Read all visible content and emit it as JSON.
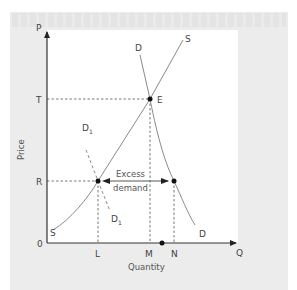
{
  "diagram": {
    "type": "supply-demand",
    "axes": {
      "y_symbol": "P",
      "x_symbol": "Q",
      "y_title": "Price",
      "x_title": "Quantity",
      "origin": "0"
    },
    "price_levels": [
      {
        "label": "T",
        "note": "equilibrium price"
      },
      {
        "label": "R",
        "note": "controlled price"
      }
    ],
    "quantity_levels": [
      {
        "label": "L"
      },
      {
        "label": "M"
      },
      {
        "label": "N"
      }
    ],
    "curves": [
      {
        "id": "supply",
        "label_top": "S",
        "label_bottom": "S",
        "style": "solid"
      },
      {
        "id": "demand",
        "label_top": "D",
        "label_bottom": "D",
        "style": "solid"
      },
      {
        "id": "demand-1",
        "label_top": "D",
        "label_top_sub": "1",
        "label_bottom": "D",
        "label_bottom_sub": "1",
        "style": "dashed"
      }
    ],
    "points": [
      {
        "label": "E",
        "at": "T-M"
      },
      {
        "label": "",
        "at": "R-L"
      },
      {
        "label": "",
        "at": "R-N"
      },
      {
        "label": "",
        "at": "Q-axis between M and N"
      }
    ],
    "annotation": {
      "line1": "Excess",
      "line2": "demand"
    },
    "colors": {
      "curve": "#8a8a8a",
      "axis": "#333333",
      "dash": "#555555",
      "panel": "#ffffff",
      "page": "#ececec"
    }
  }
}
